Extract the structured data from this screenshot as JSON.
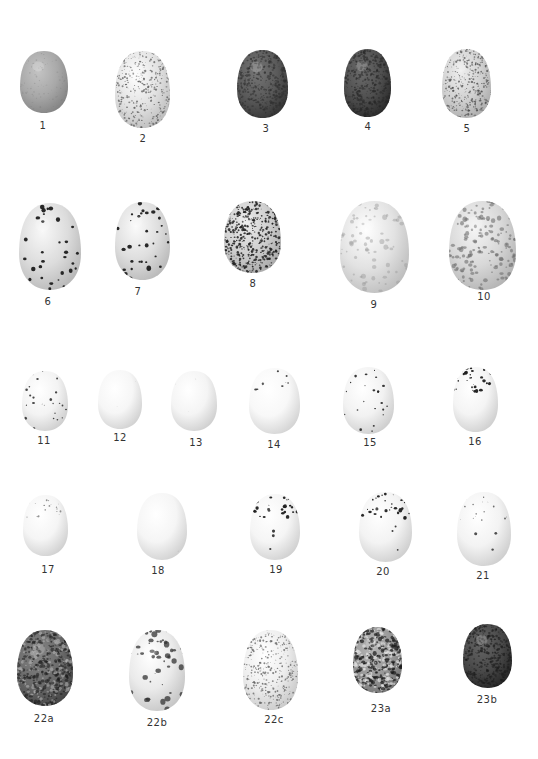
{
  "plate": {
    "background": "#ffffff",
    "eggs": [
      {
        "id": "1",
        "label": "1",
        "base": "#a8a8a8",
        "spot": "#7a7a7a",
        "density": "fine",
        "pattern": "dusted"
      },
      {
        "id": "2",
        "label": "2",
        "base": "#e2e2e2",
        "spot": "#555555",
        "density": "dense",
        "pattern": "fine-speckled"
      },
      {
        "id": "3",
        "label": "3",
        "base": "#5a5a5a",
        "spot": "#2e2e2e",
        "density": "dense",
        "pattern": "dark-mottled"
      },
      {
        "id": "4",
        "label": "4",
        "base": "#505050",
        "spot": "#262626",
        "density": "dense",
        "pattern": "dark-mottled"
      },
      {
        "id": "5",
        "label": "5",
        "base": "#d2d2d2",
        "spot": "#4a4a4a",
        "density": "dense",
        "pattern": "fine-speckled"
      },
      {
        "id": "6",
        "label": "6",
        "base": "#dcdcdc",
        "spot": "#1e1e1e",
        "density": "sparse",
        "pattern": "bold-spotted"
      },
      {
        "id": "7",
        "label": "7",
        "base": "#dedede",
        "spot": "#1e1e1e",
        "density": "sparse",
        "pattern": "bold-spotted"
      },
      {
        "id": "8",
        "label": "8",
        "base": "#cfcfcf",
        "spot": "#222222",
        "density": "dense",
        "pattern": "heavy-speckled"
      },
      {
        "id": "9",
        "label": "9",
        "base": "#e2e2e2",
        "spot": "#9a9a9a",
        "density": "medium",
        "pattern": "blotched-pale"
      },
      {
        "id": "10",
        "label": "10",
        "base": "#d8d8d8",
        "spot": "#6e6e6e",
        "density": "dense",
        "pattern": "blotched"
      },
      {
        "id": "11",
        "label": "11",
        "base": "#f3f3f3",
        "spot": "#333333",
        "density": "sparse",
        "pattern": "few-spots"
      },
      {
        "id": "12",
        "label": "12",
        "base": "#f6f6f6",
        "spot": "#aaaaaa",
        "density": "none",
        "pattern": "plain"
      },
      {
        "id": "13",
        "label": "13",
        "base": "#f4f4f4",
        "spot": "#aaaaaa",
        "density": "none",
        "pattern": "plain"
      },
      {
        "id": "14",
        "label": "14",
        "base": "#f8f8f8",
        "spot": "#333333",
        "density": "cap",
        "pattern": "capped-few"
      },
      {
        "id": "15",
        "label": "15",
        "base": "#f2f2f2",
        "spot": "#222222",
        "density": "sparse",
        "pattern": "few-spots"
      },
      {
        "id": "16",
        "label": "16",
        "base": "#f4f4f4",
        "spot": "#1e1e1e",
        "density": "cap",
        "pattern": "capped"
      },
      {
        "id": "17",
        "label": "17",
        "base": "#f5f5f5",
        "spot": "#666666",
        "density": "sparse",
        "pattern": "fine-cap"
      },
      {
        "id": "18",
        "label": "18",
        "base": "#f5f5f5",
        "spot": "#888888",
        "density": "none",
        "pattern": "plain"
      },
      {
        "id": "19",
        "label": "19",
        "base": "#f5f5f5",
        "spot": "#1e1e1e",
        "density": "cap",
        "pattern": "capped"
      },
      {
        "id": "20",
        "label": "20",
        "base": "#f3f3f3",
        "spot": "#1e1e1e",
        "density": "cap",
        "pattern": "capped"
      },
      {
        "id": "21",
        "label": "21",
        "base": "#f3f3f3",
        "spot": "#333333",
        "density": "cap",
        "pattern": "fine-cap"
      },
      {
        "id": "22a",
        "label": "22a",
        "base": "#6a6a6a",
        "spot": "#1e1e1e",
        "density": "dense",
        "pattern": "marbled-dark"
      },
      {
        "id": "22b",
        "label": "22b",
        "base": "#eaeaea",
        "spot": "#333333",
        "density": "medium",
        "pattern": "blotched-cap"
      },
      {
        "id": "22c",
        "label": "22c",
        "base": "#eeeeee",
        "spot": "#555555",
        "density": "medium",
        "pattern": "fine-speckled"
      },
      {
        "id": "23a",
        "label": "23a",
        "base": "#9a9a9a",
        "spot": "#1a1a1a",
        "density": "dense",
        "pattern": "marbled"
      },
      {
        "id": "23b",
        "label": "23b",
        "base": "#4a4a4a",
        "spot": "#1a1a1a",
        "density": "dense",
        "pattern": "dark-mottled"
      }
    ]
  }
}
